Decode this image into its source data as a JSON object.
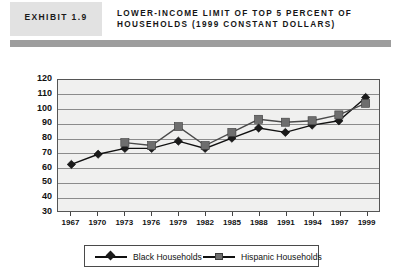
{
  "header": {
    "badge_label": "EXHIBIT 1.9",
    "title_line1": "LOWER-INCOME LIMIT OF TOP 5 PERCENT OF",
    "title_line2": "HOUSEHOLDS (1999 CONSTANT DOLLARS)"
  },
  "colors": {
    "badge_bg": "#e2e2e2",
    "rule_bg": "#9d9d9d",
    "plot_bg": "#f0f0ef",
    "gridline": "#8b8b8b",
    "series_black": "#1b1b1b",
    "series_hispanic": "#6e6e6e"
  },
  "chart_data": {
    "type": "line",
    "title": "LOWER-INCOME LIMIT OF TOP 5 PERCENT OF HOUSEHOLDS (1999 CONSTANT DOLLARS)",
    "xlabel": "",
    "ylabel": "Thousands of Dollars",
    "ylim": [
      30,
      120
    ],
    "ytick_step": 10,
    "yticks": [
      120,
      110,
      100,
      90,
      80,
      70,
      60,
      50,
      40,
      30
    ],
    "grid": true,
    "legend_position": "bottom",
    "categories": [
      1967,
      1970,
      1973,
      1976,
      1979,
      1982,
      1985,
      1988,
      1991,
      1994,
      1997,
      1999
    ],
    "xtick_labels": [
      "1967",
      "1970",
      "1973",
      "1976",
      "1979",
      "1982",
      "1985",
      "1988",
      "1991",
      "1994",
      "1997",
      "1999"
    ],
    "series": [
      {
        "name": "Black Households",
        "marker": "diamond",
        "color": "#1b1b1b",
        "values": [
          62,
          69,
          73,
          73,
          78,
          73,
          80,
          87,
          84,
          89,
          92,
          108
        ]
      },
      {
        "name": "Hispanic Households",
        "marker": "square",
        "color": "#6e6e6e",
        "values": [
          null,
          null,
          77,
          75,
          88,
          75,
          84,
          93,
          91,
          92,
          96,
          104
        ]
      }
    ]
  },
  "legend": {
    "items": [
      {
        "label": "Black Households",
        "marker": "diamond-marker-icon"
      },
      {
        "label": "Hispanic Households",
        "marker": "square-marker-icon"
      }
    ]
  }
}
